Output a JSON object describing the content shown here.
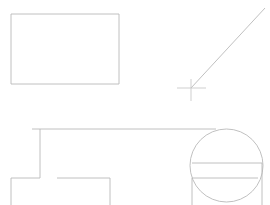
{
  "canvas": {
    "width": 270,
    "height": 205,
    "background_color": "#ffffff",
    "stroke_color": "#b9b9b9",
    "stroke_color_faint": "#c6c6c6",
    "stroke_width": 0.9,
    "title": "CAD line drawing"
  },
  "shapes": {
    "rectangle": {
      "name": "rectangle",
      "x": 11,
      "y": 14,
      "width": 108,
      "height": 70
    },
    "diagonal_line": {
      "name": "diagonal-line",
      "x1": 191,
      "y1": 88,
      "x2": 265,
      "y2": 8
    },
    "crosshair": {
      "name": "crosshair-marker",
      "center_x": 191,
      "center_y": 88,
      "horizontal_x1": 177,
      "horizontal_x2": 206,
      "vertical_y1": 79,
      "vertical_y2": 101
    },
    "circle": {
      "name": "circle",
      "center_x": 226.5,
      "center_y": 165.5,
      "radius": 36.5
    },
    "top_rail": {
      "name": "top-rail-line",
      "x1": 32,
      "y1": 129,
      "x2": 216,
      "y2": 129
    },
    "upper_vertical": {
      "name": "upper-vertical-line",
      "x": 40,
      "y1": 129,
      "y2": 178
    },
    "lower_left_horizontal": {
      "name": "lower-left-horizontal-line",
      "x1": 11,
      "y1": 178,
      "x2": 40,
      "y2": 178
    },
    "left_edge_vertical": {
      "name": "left-edge-vertical-line",
      "x": 11,
      "y1": 178,
      "y2": 205
    },
    "inner_horizontal": {
      "name": "inner-horizontal-line",
      "x1": 57,
      "y1": 178,
      "x2": 110,
      "y2": 178
    },
    "inner_vertical": {
      "name": "inner-vertical-line",
      "x": 110,
      "y1": 178,
      "y2": 205
    },
    "circle_chord_upper": {
      "name": "circle-chord-upper-line",
      "x1": 192,
      "y1": 163,
      "x2": 262,
      "y2": 163
    },
    "circle_chord_lower": {
      "name": "circle-chord-lower-line",
      "x1": 192,
      "y1": 178,
      "x2": 258,
      "y2": 178
    },
    "circle_left_vertical": {
      "name": "circle-left-vertical-line",
      "x": 192,
      "y1": 178,
      "y2": 205
    },
    "circle_right_vertical": {
      "name": "circle-right-vertical-line",
      "x": 262,
      "y1": 163,
      "y2": 205
    }
  }
}
